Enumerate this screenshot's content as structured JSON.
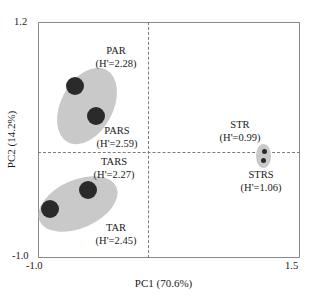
{
  "chart_data": {
    "type": "scatter",
    "title": "",
    "xlabel": "PC1 (70.6%)",
    "ylabel": "PC2 (14.2%)",
    "xlim": [
      -1.0,
      1.5
    ],
    "ylim": [
      -1.0,
      1.2
    ],
    "xticks": [
      "-1.0",
      "1.5"
    ],
    "yticks": [
      "-1.0",
      "1.2"
    ],
    "grid": false,
    "legend": "none",
    "reference_lines": {
      "horizontal_at_y": 0.0,
      "vertical_at_x": 0.0,
      "style": "dashed"
    },
    "groups": [
      {
        "code": "PAR",
        "diversity_label": "(H'=2.28)",
        "diversity_symbol": "H'",
        "diversity_value": 2.28,
        "points": [
          {
            "x": -0.7,
            "y": 0.7
          },
          {
            "x": -0.5,
            "y": 0.42
          }
        ]
      },
      {
        "code": "PARS",
        "diversity_label": "(H'=2.59)",
        "diversity_symbol": "H'",
        "diversity_value": 2.59,
        "points": [
          {
            "x": -0.5,
            "y": 0.42
          }
        ]
      },
      {
        "code": "TARS",
        "diversity_label": "(H'=2.27)",
        "diversity_symbol": "H'",
        "diversity_value": 2.27,
        "points": [
          {
            "x": -0.58,
            "y": -0.26
          }
        ]
      },
      {
        "code": "TAR",
        "diversity_label": "(H'=2.45)",
        "diversity_symbol": "H'",
        "diversity_value": 2.45,
        "points": [
          {
            "x": -0.93,
            "y": -0.44
          }
        ]
      },
      {
        "code": "STR",
        "diversity_label": "(H'=0.99)",
        "diversity_symbol": "H'",
        "diversity_value": 0.99,
        "points": [
          {
            "x": 1.14,
            "y": 0.02
          }
        ]
      },
      {
        "code": "STRS",
        "diversity_label": "(H'=1.06)",
        "diversity_symbol": "H'",
        "diversity_value": 1.06,
        "points": [
          {
            "x": 1.13,
            "y": -0.06
          }
        ]
      }
    ],
    "colors": {
      "point": "#2a2a2a",
      "cluster_fill": "#c9c9c9",
      "frame": "#8a8a8a",
      "reference_line": "#7c7c7c",
      "text": "#1a1a1a"
    }
  },
  "axes": {
    "x_title": "PC1 (70.6%)",
    "y_title": "PC2 (14.2%)",
    "y_top_tick": "1.2",
    "y_bottom_tick": "-1.0",
    "x_left_tick": "-1.0",
    "x_right_tick": "1.5"
  },
  "annotations": {
    "par": {
      "code": "PAR",
      "diversity": "(H'=2.28)"
    },
    "pars": {
      "code": "PARS",
      "diversity": "(H'=2.59)"
    },
    "tars": {
      "code": "TARS",
      "diversity": "(H'=2.27)"
    },
    "tar": {
      "code": "TAR",
      "diversity": "(H'=2.45)"
    },
    "str": {
      "code": "STR",
      "diversity": "(H'=0.99)"
    },
    "strs": {
      "code": "STRS",
      "diversity": "(H'=1.06)"
    }
  }
}
